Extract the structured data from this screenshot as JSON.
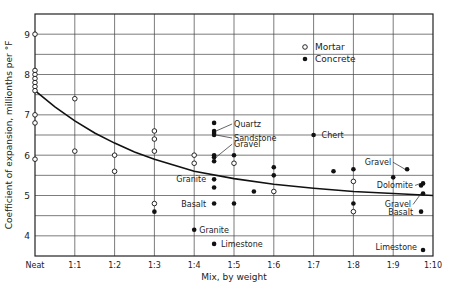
{
  "chart_data": {
    "type": "scatter",
    "title": "",
    "xlabel": "Mix, by weight",
    "ylabel": "Coefficient of expansion, millionths per °F",
    "x_ticks": [
      "Neat",
      "1:1",
      "1:2",
      "1:3",
      "1:4",
      "1:5",
      "1:6",
      "1:7",
      "1:8",
      "1:9",
      "1:10"
    ],
    "y_ticks": [
      4,
      5,
      6,
      7,
      8,
      9
    ],
    "xlim": [
      0,
      10
    ],
    "ylim": [
      3.5,
      9.5
    ],
    "grid": true,
    "legend": {
      "position": "upper-center",
      "entries": [
        {
          "name": "Mortar",
          "marker": "open-circle"
        },
        {
          "name": "Concrete",
          "marker": "filled-circle"
        }
      ]
    },
    "series": [
      {
        "name": "Mortar",
        "marker": "open",
        "points": [
          [
            0,
            9.0
          ],
          [
            0,
            8.1
          ],
          [
            0,
            8.0
          ],
          [
            0,
            7.9
          ],
          [
            0,
            7.8
          ],
          [
            0,
            7.7
          ],
          [
            0,
            7.6
          ],
          [
            0,
            7.0
          ],
          [
            0,
            6.8
          ],
          [
            0,
            5.9
          ],
          [
            1,
            7.4
          ],
          [
            1,
            6.1
          ],
          [
            2,
            6.0
          ],
          [
            2,
            5.6
          ],
          [
            3,
            6.6
          ],
          [
            3,
            6.4
          ],
          [
            3,
            6.1
          ],
          [
            3,
            4.8
          ],
          [
            4,
            6.0
          ],
          [
            4,
            5.8
          ],
          [
            5,
            5.8
          ],
          [
            6,
            5.1
          ],
          [
            8,
            5.35
          ],
          [
            8,
            4.6
          ]
        ]
      },
      {
        "name": "Concrete",
        "marker": "filled",
        "points": [
          [
            3,
            4.6
          ],
          [
            4,
            4.15
          ],
          [
            4.5,
            6.8
          ],
          [
            4.5,
            6.6
          ],
          [
            4.5,
            6.55
          ],
          [
            4.5,
            6.5
          ],
          [
            4.5,
            6.0
          ],
          [
            4.5,
            5.95
          ],
          [
            4.5,
            5.85
          ],
          [
            4.5,
            5.4
          ],
          [
            4.5,
            5.2
          ],
          [
            4.5,
            4.8
          ],
          [
            4.5,
            3.8
          ],
          [
            5,
            6.0
          ],
          [
            5,
            4.8
          ],
          [
            5.5,
            5.1
          ],
          [
            6,
            5.7
          ],
          [
            6,
            5.5
          ],
          [
            7,
            6.5
          ],
          [
            7.5,
            5.6
          ],
          [
            8,
            5.65
          ],
          [
            8,
            4.8
          ],
          [
            9,
            5.45
          ],
          [
            9.35,
            5.65
          ],
          [
            9.75,
            5.3
          ],
          [
            9.7,
            5.25
          ],
          [
            9.75,
            5.05
          ],
          [
            9.7,
            4.6
          ],
          [
            9.75,
            3.65
          ]
        ]
      },
      {
        "name": "Trend",
        "type": "line",
        "points": [
          [
            0,
            7.6
          ],
          [
            0.5,
            7.2
          ],
          [
            1,
            6.85
          ],
          [
            1.5,
            6.55
          ],
          [
            2,
            6.3
          ],
          [
            2.5,
            6.08
          ],
          [
            3,
            5.9
          ],
          [
            3.5,
            5.75
          ],
          [
            4,
            5.6
          ],
          [
            5,
            5.42
          ],
          [
            6,
            5.28
          ],
          [
            7,
            5.18
          ],
          [
            8,
            5.1
          ],
          [
            9,
            5.05
          ],
          [
            10,
            5.0
          ]
        ]
      }
    ],
    "annotations": [
      {
        "text": "Quartz",
        "x": 4.5,
        "y": 6.6
      },
      {
        "text": "Sandstone",
        "x": 4.5,
        "y": 6.5
      },
      {
        "text": "Gravel",
        "x": 4.5,
        "y": 5.95
      },
      {
        "text": "Granite",
        "x": 4.5,
        "y": 5.4
      },
      {
        "text": "Basalt",
        "x": 4.5,
        "y": 4.8
      },
      {
        "text": "Granite",
        "x": 4,
        "y": 4.15
      },
      {
        "text": "Limestone",
        "x": 4.5,
        "y": 3.8
      },
      {
        "text": "Chert",
        "x": 7,
        "y": 6.5
      },
      {
        "text": "Gravel",
        "x": 9.35,
        "y": 5.65
      },
      {
        "text": "Dolomite",
        "x": 9.75,
        "y": 5.3
      },
      {
        "text": "Gravel",
        "x": 9.75,
        "y": 5.05
      },
      {
        "text": "Basalt",
        "x": 9.7,
        "y": 4.6
      },
      {
        "text": "Limestone",
        "x": 9.75,
        "y": 3.65
      }
    ]
  }
}
